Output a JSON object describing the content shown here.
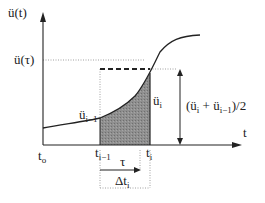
{
  "diagram": {
    "y_axis_label": "ü(t)",
    "x_axis_label": "t",
    "tau_level_label": "ü(τ)",
    "left_value_label": {
      "base": "ü",
      "sub": "i−1"
    },
    "right_value_label": {
      "base": "ü",
      "sub": "i"
    },
    "average_label": {
      "prefix": "(ü",
      "s1": "i",
      "mid": " + ü",
      "s2": "i−1",
      "suffix": ")/2"
    },
    "t0_label": {
      "base": "t",
      "sub": "o"
    },
    "ti1_label": {
      "base": "t",
      "sub": "i−1"
    },
    "ti_label": {
      "base": "t",
      "sub": "i"
    },
    "tau_label": "τ",
    "delta_t_label": {
      "base": "Δt",
      "sub": "i"
    },
    "colors": {
      "fill": "#8a8a8a",
      "line": "#222222",
      "dotted": "#888888"
    }
  }
}
